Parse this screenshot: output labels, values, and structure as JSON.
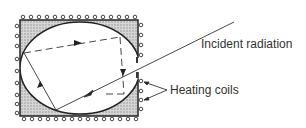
{
  "diagram": {
    "labels": {
      "incident_radiation": "Incident radiation",
      "heating_coils": "Heating coils"
    },
    "colors": {
      "line": "#222222",
      "hatch_fill": "#bdbdbd",
      "text": "#333333",
      "background": "#ffffff"
    },
    "components": [
      "enclosure-box",
      "elliptical-cavity",
      "cavity-opening",
      "incident-ray",
      "reflected-rays",
      "heating-coil-loops",
      "heating-coil-pointers"
    ]
  }
}
